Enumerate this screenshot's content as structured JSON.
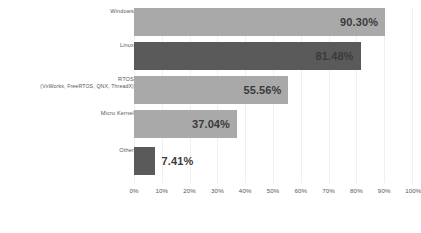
{
  "chart_data": {
    "type": "bar",
    "orientation": "horizontal",
    "title": "",
    "xlabel": "",
    "ylabel": "",
    "xlim": [
      0,
      100
    ],
    "grid": true,
    "legend": "none",
    "categories": [
      "Windows",
      "Linux",
      "RTOS",
      "Micro Kernel",
      "Other"
    ],
    "category_sublabels": [
      "",
      "",
      "(VxWorks, FreeRTOS, QNX, ThreadX)",
      "",
      ""
    ],
    "values": [
      90.3,
      81.48,
      55.56,
      37.04,
      7.41
    ],
    "value_labels": [
      "90.30%",
      "81.48%",
      "55.56%",
      "37.04%",
      "7.41%"
    ],
    "bar_colors": [
      "#a9a9a9",
      "#5a5a5a",
      "#a9a9a9",
      "#a9a9a9",
      "#5a5a5a"
    ],
    "label_placement": [
      "inside",
      "inside",
      "inside",
      "inside",
      "outside"
    ],
    "xticks": [
      0,
      10,
      20,
      30,
      40,
      50,
      60,
      70,
      80,
      90,
      100
    ],
    "xtick_labels": [
      "0%",
      "10%",
      "20%",
      "30%",
      "40%",
      "50%",
      "60%",
      "70%",
      "80%",
      "90%",
      "100%"
    ]
  },
  "bars": [
    {
      "label": "Windows",
      "sublabel": "",
      "value_label": "90.30%"
    },
    {
      "label": "Linux",
      "sublabel": "",
      "value_label": "81.48%"
    },
    {
      "label": "RTOS",
      "sublabel": "(VxWorks, FreeRTOS, QNX, ThreadX)",
      "value_label": "55.56%"
    },
    {
      "label": "Micro Kernel",
      "sublabel": "",
      "value_label": "37.04%"
    },
    {
      "label": "Other",
      "sublabel": "",
      "value_label": "7.41%"
    }
  ],
  "caption": {
    "text": ""
  },
  "colors": {
    "bar_light": "#a9a9a9",
    "bar_dark": "#5a5a5a",
    "text": "#54585a",
    "value_text": "#3a3a3a",
    "gridline": "#f0f0f0",
    "background": "#ffffff"
  }
}
